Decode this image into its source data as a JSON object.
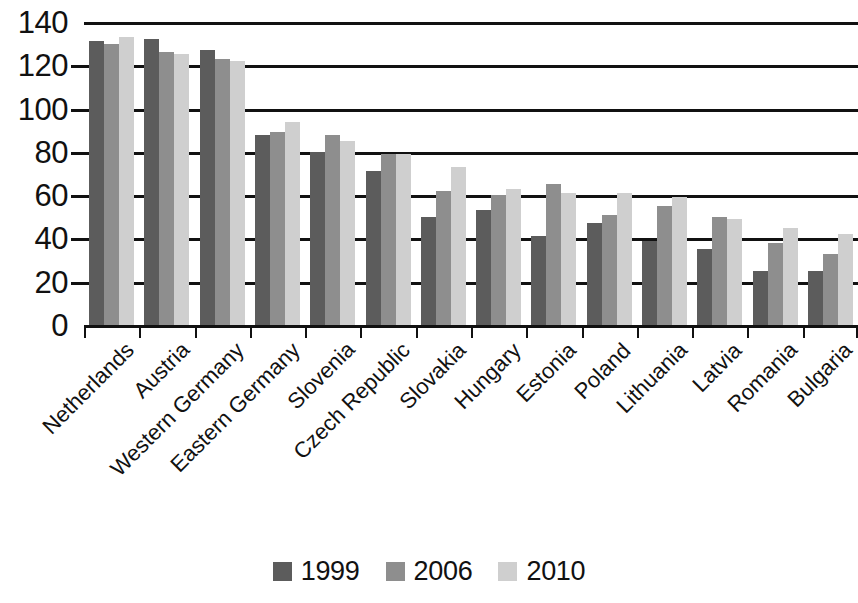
{
  "chart_data": {
    "type": "bar",
    "title": "",
    "subtitle": "",
    "xlabel": "",
    "ylabel": "",
    "ylim": [
      0,
      140
    ],
    "y_ticks": [
      0,
      20,
      40,
      60,
      80,
      100,
      120,
      140
    ],
    "grid": true,
    "legend_position": "bottom",
    "categories": [
      "Netherlands",
      "Austria",
      "Western Germany",
      "Eastern Germany",
      "Slovenia",
      "Czech Republic",
      "Slovakia",
      "Hungary",
      "Estonia",
      "Poland",
      "Lithuania",
      "Latvia",
      "Romania",
      "Bulgaria"
    ],
    "series": [
      {
        "name": "1999",
        "color": "#5c5c5c",
        "values": [
          131,
          132,
          127,
          88,
          80,
          71,
          50,
          53,
          41,
          47,
          39,
          35,
          25,
          25
        ]
      },
      {
        "name": "2006",
        "color": "#8e8e8e",
        "values": [
          130,
          126,
          123,
          89,
          88,
          79,
          62,
          60,
          65,
          51,
          55,
          50,
          38,
          33
        ]
      },
      {
        "name": "2010",
        "color": "#cfcfcf",
        "values": [
          133,
          125,
          122,
          94,
          85,
          79,
          73,
          63,
          61,
          61,
          59,
          49,
          45,
          42
        ]
      }
    ]
  },
  "legend": {
    "items": [
      {
        "label": "1999",
        "series_key": "s1999"
      },
      {
        "label": "2006",
        "series_key": "s2006"
      },
      {
        "label": "2010",
        "series_key": "s2010"
      }
    ]
  }
}
